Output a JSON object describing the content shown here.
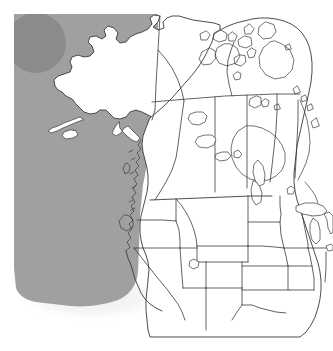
{
  "figure": {
    "kind": "reference-outline-map",
    "width": 333,
    "height": 351,
    "background_color": "#ffffff"
  },
  "map": {
    "projection_note": "conic, north-up",
    "land_fill": "#ffffff",
    "outline_color": "#3a3a3a",
    "outline_width_major": 0.9,
    "outline_width_minor": 0.7,
    "regions": [
      {
        "id": "alaska",
        "label": "Alaska",
        "kind": "state"
      },
      {
        "id": "yukon",
        "label": "Yukon",
        "kind": "territory"
      },
      {
        "id": "northwest-territories",
        "label": "Northwest Territories",
        "kind": "territory"
      },
      {
        "id": "nunavut",
        "label": "Nunavut",
        "kind": "territory"
      },
      {
        "id": "british-columbia",
        "label": "British Columbia",
        "kind": "province"
      },
      {
        "id": "alberta",
        "label": "Alberta",
        "kind": "province"
      },
      {
        "id": "saskatchewan",
        "label": "Saskatchewan",
        "kind": "province"
      },
      {
        "id": "manitoba",
        "label": "Manitoba",
        "kind": "province"
      },
      {
        "id": "ontario",
        "label": "Ontario",
        "kind": "province"
      },
      {
        "id": "quebec",
        "label": "Quebec",
        "kind": "province"
      },
      {
        "id": "washington",
        "label": "Washington",
        "kind": "state"
      },
      {
        "id": "oregon",
        "label": "Oregon",
        "kind": "state"
      },
      {
        "id": "california",
        "label": "California",
        "kind": "state"
      },
      {
        "id": "idaho",
        "label": "Idaho",
        "kind": "state"
      },
      {
        "id": "nevada",
        "label": "Nevada",
        "kind": "state"
      },
      {
        "id": "utah",
        "label": "Utah",
        "kind": "state"
      },
      {
        "id": "arizona",
        "label": "Arizona",
        "kind": "state"
      },
      {
        "id": "montana",
        "label": "Montana",
        "kind": "state"
      },
      {
        "id": "wyoming",
        "label": "Wyoming",
        "kind": "state"
      },
      {
        "id": "colorado",
        "label": "Colorado",
        "kind": "state"
      },
      {
        "id": "new-mexico",
        "label": "New Mexico",
        "kind": "state"
      },
      {
        "id": "north-dakota",
        "label": "North Dakota",
        "kind": "state"
      },
      {
        "id": "south-dakota",
        "label": "South Dakota",
        "kind": "state"
      },
      {
        "id": "nebraska",
        "label": "Nebraska",
        "kind": "state"
      },
      {
        "id": "kansas",
        "label": "Kansas",
        "kind": "state"
      },
      {
        "id": "oklahoma",
        "label": "Oklahoma",
        "kind": "state"
      },
      {
        "id": "texas",
        "label": "Texas",
        "kind": "state"
      },
      {
        "id": "minnesota",
        "label": "Minnesota",
        "kind": "state"
      },
      {
        "id": "iowa",
        "label": "Iowa",
        "kind": "state"
      },
      {
        "id": "missouri",
        "label": "Missouri",
        "kind": "state"
      },
      {
        "id": "wisconsin",
        "label": "Wisconsin",
        "kind": "state"
      },
      {
        "id": "illinois",
        "label": "Illinois",
        "kind": "state"
      },
      {
        "id": "michigan",
        "label": "Michigan",
        "kind": "state"
      },
      {
        "id": "indiana",
        "label": "Indiana",
        "kind": "state"
      },
      {
        "id": "ohio",
        "label": "Ohio",
        "kind": "state"
      },
      {
        "id": "kentucky",
        "label": "Kentucky",
        "kind": "state"
      },
      {
        "id": "arkansas",
        "label": "Arkansas",
        "kind": "state"
      }
    ],
    "water_features": [
      {
        "id": "pacific-ocean",
        "label": "Pacific Ocean",
        "kind": "ocean"
      },
      {
        "id": "hudson-bay",
        "label": "Hudson Bay",
        "kind": "bay"
      },
      {
        "id": "great-bear-lake",
        "label": "Great Bear Lake",
        "kind": "lake"
      },
      {
        "id": "great-slave-lake",
        "label": "Great Slave Lake",
        "kind": "lake"
      },
      {
        "id": "lake-winnipeg",
        "label": "Lake Winnipeg",
        "kind": "lake"
      },
      {
        "id": "lake-athabasca",
        "label": "Lake Athabasca",
        "kind": "lake"
      },
      {
        "id": "great-salt-lake",
        "label": "Great Salt Lake",
        "kind": "lake"
      },
      {
        "id": "lake-superior",
        "label": "Lake Superior",
        "kind": "lake"
      },
      {
        "id": "lake-michigan",
        "label": "Lake Michigan",
        "kind": "lake"
      },
      {
        "id": "lake-huron",
        "label": "Lake Huron",
        "kind": "lake"
      },
      {
        "id": "lake-erie",
        "label": "Lake Erie",
        "kind": "lake"
      },
      {
        "id": "lake-ontario",
        "label": "Lake Ontario",
        "kind": "lake"
      }
    ]
  },
  "overlay": {
    "ocean_shading": {
      "name": "pacific-ocean-shading",
      "fill": "#a0a0a0",
      "opacity": 1
    },
    "highlight_circle": {
      "name": "ocean-highlight-circle",
      "fill": "#8b8b8b",
      "center_x": 36,
      "center_y": 43,
      "radius": 30
    },
    "soft_halo": {
      "name": "ocean-edge-halo",
      "fill": "#f1f1f1"
    }
  }
}
